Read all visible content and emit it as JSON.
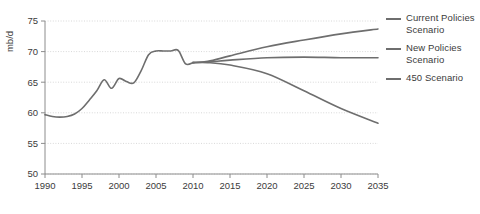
{
  "chart_data": {
    "type": "line",
    "title": "",
    "xlabel": "",
    "ylabel": "mb/d",
    "xlim": [
      1990,
      2035
    ],
    "ylim": [
      50,
      75
    ],
    "xticks": [
      1990,
      1995,
      2000,
      2005,
      2010,
      2015,
      2020,
      2025,
      2030,
      2035
    ],
    "yticks": [
      50,
      55,
      60,
      65,
      70,
      75
    ],
    "grid": true,
    "legend_position": "right",
    "line_color": "#6e6e6e",
    "grid_color": "#d8d8d8",
    "axis_color": "#8c8c8c",
    "text_color": "#3b3b3b",
    "series": [
      {
        "name": "Historical",
        "legend": false,
        "x": [
          1990,
          1991,
          1992,
          1993,
          1994,
          1995,
          1996,
          1997,
          1998,
          1999,
          2000,
          2001,
          2002,
          2003,
          2004,
          2005,
          2006,
          2007,
          2008,
          2009,
          2010
        ],
        "values": [
          59.7,
          59.4,
          59.3,
          59.4,
          59.8,
          60.7,
          62.1,
          63.6,
          65.4,
          64.0,
          65.6,
          65.1,
          64.9,
          66.9,
          69.5,
          70.1,
          70.1,
          70.1,
          70.2,
          68.0,
          68.2
        ]
      },
      {
        "name": "Current Policies Scenario",
        "legend": true,
        "x": [
          2010,
          2012,
          2015,
          2020,
          2025,
          2030,
          2035
        ],
        "values": [
          68.2,
          68.4,
          69.3,
          70.8,
          71.9,
          72.9,
          73.7
        ]
      },
      {
        "name": "New Policies Scenario",
        "legend": true,
        "x": [
          2010,
          2012,
          2015,
          2020,
          2025,
          2030,
          2035
        ],
        "values": [
          68.2,
          68.3,
          68.6,
          69.0,
          69.1,
          69.0,
          69.0
        ]
      },
      {
        "name": "450 Scenario",
        "legend": true,
        "x": [
          2010,
          2012,
          2015,
          2020,
          2025,
          2030,
          2035
        ],
        "values": [
          68.2,
          68.2,
          67.8,
          66.4,
          63.6,
          60.7,
          58.3
        ]
      }
    ]
  },
  "legend": {
    "items": [
      {
        "label": "Current Policies Scenario"
      },
      {
        "label": "New Policies Scenario"
      },
      {
        "label": "450 Scenario"
      }
    ]
  }
}
